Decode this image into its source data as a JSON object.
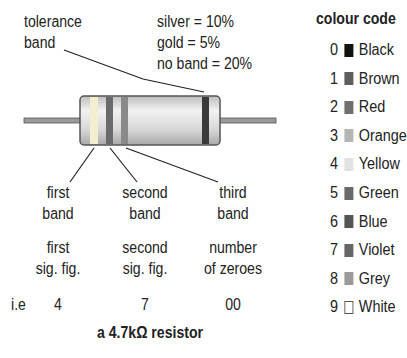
{
  "diagram": {
    "tolerance_label": [
      "tolerance",
      "band"
    ],
    "tolerance_values": [
      "silver = 10%",
      "gold = 5%",
      "no band = 20%"
    ],
    "bands": [
      {
        "label": [
          "first",
          "band"
        ],
        "meaning": [
          "first",
          "sig. fig."
        ],
        "example": "4",
        "color": "#f2efd0"
      },
      {
        "label": [
          "second",
          "band"
        ],
        "meaning": [
          "second",
          "sig. fig."
        ],
        "example": "7",
        "color": "#6a6a6a"
      },
      {
        "label": [
          "third",
          "band"
        ],
        "meaning": [
          "number",
          "of zeroes"
        ],
        "example": "00",
        "color": "#8a8a8a"
      }
    ],
    "tolerance_band_color": "#3a3a3a",
    "example_prefix": "i.e",
    "caption": "a 4.7kΩ resistor"
  },
  "legend": {
    "title": "colour code",
    "items": [
      {
        "digit": "0",
        "name": "Black",
        "swatch": "#111111"
      },
      {
        "digit": "1",
        "name": "Brown",
        "swatch": "#5e5e5e"
      },
      {
        "digit": "2",
        "name": "Red",
        "swatch": "#6f6f6f"
      },
      {
        "digit": "3",
        "name": "Orange",
        "swatch": "#b5b5b5"
      },
      {
        "digit": "4",
        "name": "Yellow",
        "swatch": "#e2e2e2"
      },
      {
        "digit": "5",
        "name": "Green",
        "swatch": "#6a6a6a"
      },
      {
        "digit": "6",
        "name": "Blue",
        "swatch": "#555555"
      },
      {
        "digit": "7",
        "name": "Violet",
        "swatch": "#666666"
      },
      {
        "digit": "8",
        "name": "Grey",
        "swatch": "#9a9a9a"
      },
      {
        "digit": "9",
        "name": "White",
        "swatch": "#ffffff"
      }
    ]
  }
}
